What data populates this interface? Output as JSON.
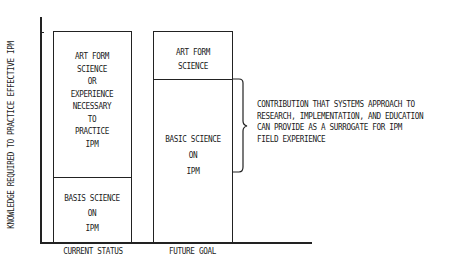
{
  "y_axis_label": "KNOWLEDGE REQUIRED TO PRACTICE EFFECTIVE IPM",
  "columns": [
    {
      "x_label": "CURRENT STATUS",
      "segments": [
        {
          "lines": [
            "ART FORM",
            "SCIENCE",
            "OR",
            "EXPERIENCE",
            "NECESSARY",
            "TO",
            "PRACTICE",
            "IPM"
          ]
        },
        {
          "lines": [
            "BASIS SCIENCE",
            "ON",
            "IPM"
          ]
        }
      ]
    },
    {
      "x_label": "FUTURE GOAL",
      "segments": [
        {
          "lines": [
            "ART FORM",
            "SCIENCE"
          ]
        },
        {
          "lines": [
            "BASIC SCIENCE",
            "ON",
            "IPM"
          ]
        }
      ]
    }
  ],
  "bracket_note": {
    "lines": [
      "CONTRIBUTION THAT SYSTEMS APPROACH TO",
      "RESEARCH, IMPLEMENTATION, AND EDUCATION",
      "CAN PROVIDE AS A SURROGATE FOR IPM",
      "FIELD EXPERIENCE"
    ]
  }
}
